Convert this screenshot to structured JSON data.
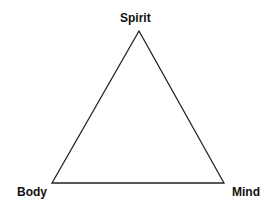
{
  "diagram": {
    "shape": "triangle",
    "stroke_color": "#222222",
    "vertices": {
      "top": {
        "label": "Spirit"
      },
      "bottom_left": {
        "label": "Body"
      },
      "bottom_right": {
        "label": "Mind"
      }
    }
  }
}
